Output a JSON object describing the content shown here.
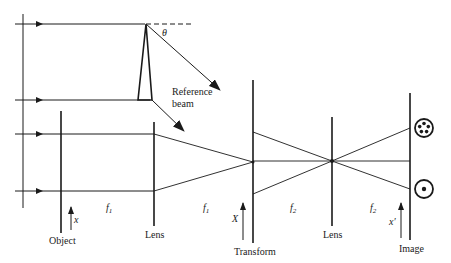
{
  "diagram": {
    "type": "optical-system"
  },
  "labels": {
    "theta": "θ",
    "reference_beam_line1": "Reference",
    "reference_beam_line2": "beam",
    "object": "Object",
    "lens1": "Lens",
    "transform": "Transform",
    "lens2": "Lens",
    "image": "Image",
    "x_axis": "x",
    "X_axis": "X",
    "x_prime_axis": "x′",
    "f1_a": "f",
    "f1_a_sub": "1",
    "f1_b": "f",
    "f1_b_sub": "1",
    "f2_a": "f",
    "f2_a_sub": "2",
    "f2_b": "f",
    "f2_b_sub": "2"
  },
  "icons": {
    "image_top": "five-dot-circle-icon",
    "image_bottom": "dot-circle-icon"
  },
  "colors": {
    "line": "#1a1a1a",
    "background": "#ffffff"
  }
}
